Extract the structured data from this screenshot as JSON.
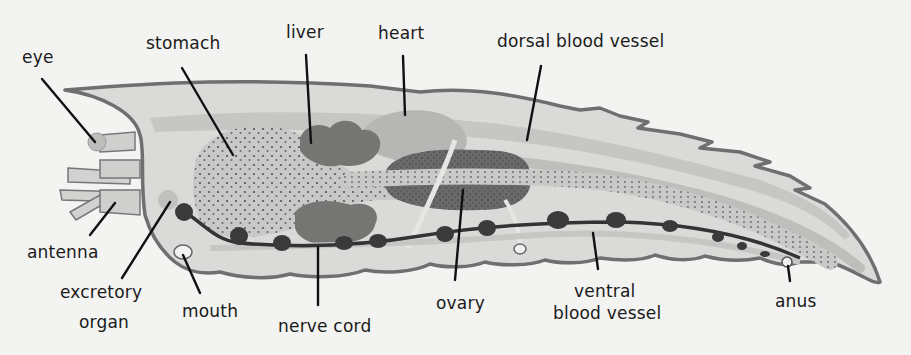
{
  "diagram": {
    "colors": {
      "background": "#f3f3f1",
      "body_fill": "#d9d9d7",
      "outline": "#6f6f6f",
      "organ_light": "#c3c3c1",
      "organ_mid": "#b3b3b1",
      "organ_dark": "#6e6e6e",
      "nerve": "#3a3a3a",
      "text": "#1a1a1a"
    },
    "labels": [
      {
        "id": "eye",
        "text": "eye"
      },
      {
        "id": "stomach",
        "text": "stomach"
      },
      {
        "id": "liver",
        "text": "liver"
      },
      {
        "id": "heart",
        "text": "heart"
      },
      {
        "id": "dorsal-blood-vessel",
        "text": "dorsal blood vessel"
      },
      {
        "id": "antenna",
        "text": "antenna"
      },
      {
        "id": "excretory-organ-line1",
        "text": "excretory"
      },
      {
        "id": "excretory-organ-line2",
        "text": "organ"
      },
      {
        "id": "mouth",
        "text": "mouth"
      },
      {
        "id": "nerve-cord",
        "text": "nerve cord"
      },
      {
        "id": "ovary",
        "text": "ovary"
      },
      {
        "id": "ventral-blood-vessel-line1",
        "text": "ventral"
      },
      {
        "id": "ventral-blood-vessel-line2",
        "text": "blood vessel"
      },
      {
        "id": "anus",
        "text": "anus"
      }
    ]
  }
}
